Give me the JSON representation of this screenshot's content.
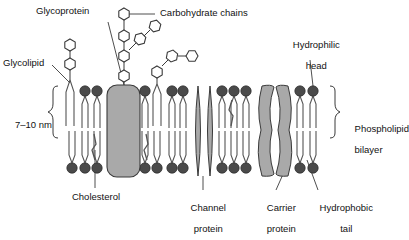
{
  "diagram": {
    "type": "biology-labelled-diagram"
  },
  "labels": {
    "glycoprotein": "Glycoprotein",
    "carbohydrate_chains": "Carbohydrate chains",
    "glycolipid": "Glycolipid",
    "hydrophilic_head_l1": "Hydrophilic",
    "hydrophilic_head_l2": "head",
    "thickness": "7–10 nm",
    "phospholipid_bilayer_l1": "Phospholipid",
    "phospholipid_bilayer_l2": "bilayer",
    "cholesterol": "Cholesterol",
    "channel_protein_l1": "Channel",
    "channel_protein_l2": "protein",
    "carrier_protein_l1": "Carrier",
    "carrier_protein_l2": "protein",
    "hydrophobic_tail_l1": "Hydrophobic",
    "hydrophobic_tail_l2": "tail"
  },
  "colors": {
    "head_fill": "#4a4a4a",
    "protein_fill": "#a9a9a9",
    "outline": "#3a3a3a",
    "tail_stroke": "#555555",
    "hexagon_fill": "#ffffff",
    "background": "#ffffff",
    "text": "#111111"
  },
  "geometry": {
    "upper_head_y": 91,
    "lower_head_y": 168,
    "head_radius": 5.2,
    "bilayer_top": 86,
    "bilayer_bottom": 173
  },
  "structures": {
    "phospholipids_upper_x": [
      85,
      97,
      145,
      172,
      183,
      222,
      234,
      246,
      300,
      312
    ],
    "phospholipids_lower_x": [
      72,
      85,
      97,
      145,
      157,
      172,
      183,
      222,
      234,
      246,
      300,
      312
    ],
    "glycolipid_left_x": 70,
    "glycolipid_mid_x": 157,
    "glycoprotein": {
      "x": 107,
      "y": 85,
      "width": 33,
      "height": 92
    },
    "channel_protein": {
      "x1": 198,
      "x2": 210
    },
    "carrier_protein": {
      "x1": 265,
      "x2": 285
    },
    "cholesterol_markers_x": [
      95,
      147,
      232
    ],
    "carbohydrate_hexagon_count_main": 4,
    "carbohydrate_hexagon_count_glycolipid_left": 2,
    "carbohydrate_hexagon_count_glycolipid_mid": 3
  }
}
